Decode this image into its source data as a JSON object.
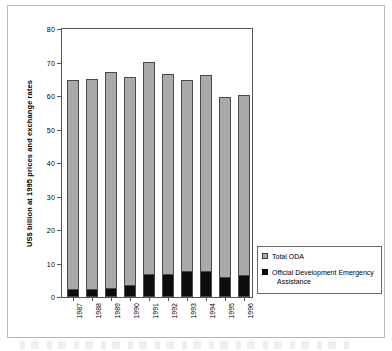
{
  "chart_data": {
    "type": "bar",
    "subtype": "stacked",
    "title": "",
    "xlabel": "",
    "ylabel": "US$ billion at 1995 prices and exchange rates",
    "ylim": [
      0,
      80
    ],
    "yticks": [
      0,
      10,
      20,
      30,
      40,
      50,
      60,
      70,
      80
    ],
    "grid": false,
    "legend_position": "right-bottom",
    "categories": [
      "1987",
      "1988",
      "1989",
      "1990",
      "1991",
      "1992",
      "1993",
      "1994",
      "1995",
      "1996"
    ],
    "series": [
      {
        "name": "Total ODA",
        "color": "#a9a9a9",
        "note": "Full bar height = total ODA",
        "values": [
          64.8,
          65.0,
          67.2,
          65.6,
          70.2,
          66.6,
          64.9,
          66.4,
          59.7,
          60.2
        ]
      },
      {
        "name": "Official Development Emergency Assistance",
        "color": "#0d0d0d",
        "note": "Black sub-segment at base of each bar",
        "values": [
          2.2,
          2.2,
          2.4,
          3.2,
          6.5,
          6.5,
          7.4,
          7.6,
          5.7,
          6.2
        ]
      }
    ]
  },
  "legend": {
    "items": [
      {
        "label": "Total ODA",
        "swatch": "gray"
      },
      {
        "label": "Official Development Emergency",
        "label_cont": "Assistance",
        "swatch": "black"
      }
    ]
  },
  "axes": {
    "y_title": "US$ billion at 1995 prices and exchange rates",
    "y_tick_labels": [
      "80",
      "70",
      "60",
      "50",
      "40",
      "30",
      "20",
      "10",
      "0"
    ],
    "x_tick_labels": [
      "1987",
      "1988",
      "1989",
      "1990",
      "1991",
      "1992",
      "1993",
      "1994",
      "1995",
      "1996"
    ]
  },
  "colors": {
    "total_oda": "#a9a9a9",
    "emergency_assistance": "#0d0d0d",
    "axis": "#555555",
    "frame": "#b9b9b9"
  }
}
